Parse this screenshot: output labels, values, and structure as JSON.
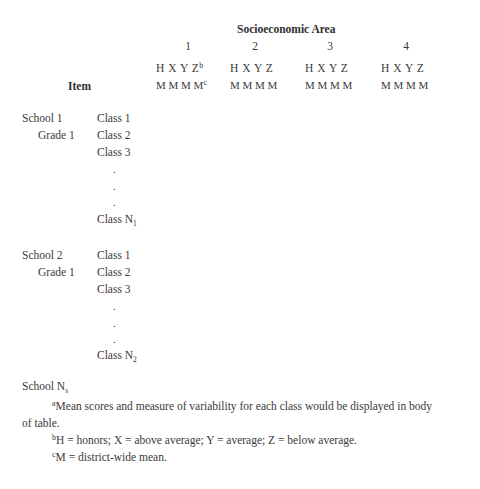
{
  "header": {
    "title": "Socioeconomic Area",
    "areas": [
      {
        "number": "1",
        "levels": "H X Y Z",
        "level_note": "b",
        "means": "M M M M",
        "mean_note": "c"
      },
      {
        "number": "2",
        "levels": "H X Y Z",
        "means": "M M M M"
      },
      {
        "number": "3",
        "levels": "H X Y Z",
        "means": "M M M M"
      },
      {
        "number": "4",
        "levels": "H X Y Z",
        "means": "M M M M"
      }
    ],
    "item_label": "Item"
  },
  "schools": [
    {
      "school": "School 1",
      "grade": "Grade 1",
      "classes": [
        "Class 1",
        "Class 2",
        "Class 3"
      ],
      "ellipsis": [
        ".",
        ".",
        "."
      ],
      "last_class": "Class N",
      "last_class_sub": "1"
    },
    {
      "school": "School 2",
      "grade": "Grade 1",
      "classes": [
        "Class 1",
        "Class 2",
        "Class 3"
      ],
      "ellipsis": [
        ".",
        ".",
        "."
      ],
      "last_class": "Class N",
      "last_class_sub": "2"
    }
  ],
  "last_school": {
    "label": "School N",
    "sub": "s"
  },
  "footnotes": [
    {
      "mark": "a",
      "text": "Mean scores and measure of variability for each class would be displayed in body",
      "continuation": "of table."
    },
    {
      "mark": "b",
      "text": "H = honors; X = above average; Y = average; Z = below average."
    },
    {
      "mark": "c",
      "text": "M = district-wide mean."
    }
  ]
}
